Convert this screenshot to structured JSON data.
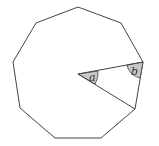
{
  "diagram": {
    "shape": "regular nonagon",
    "stroke_color": "#444444",
    "fill_color": "#ffffff",
    "angle_fill": "#c8c8c8",
    "vertices": [
      [
        78,
        7
      ],
      [
        121,
        23
      ],
      [
        143,
        62
      ],
      [
        135,
        109
      ],
      [
        101,
        138
      ],
      [
        55,
        138
      ],
      [
        20,
        108
      ],
      [
        13,
        62
      ],
      [
        36,
        23
      ]
    ],
    "center": [
      78,
      74
    ],
    "angle_labels": {
      "a": "a",
      "b": "b"
    }
  }
}
